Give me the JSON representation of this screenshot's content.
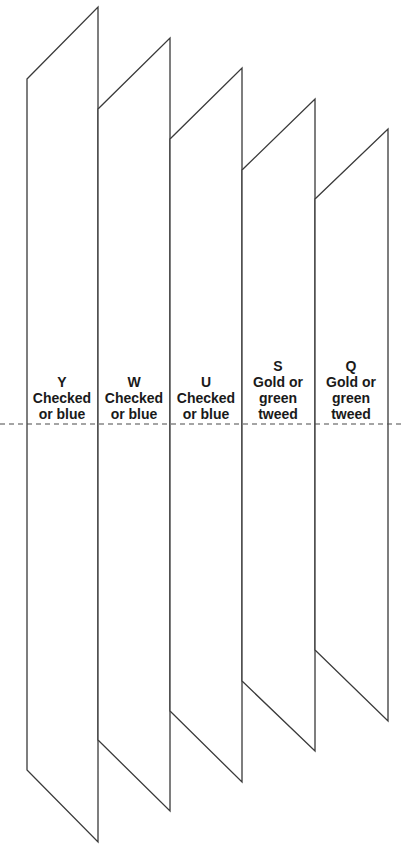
{
  "diagram": {
    "type": "folded-panels",
    "dashed_line_y": 424,
    "panels": [
      {
        "id": "Y",
        "lines": [
          "Y",
          "Checked",
          "or blue"
        ],
        "points": [
          [
            27,
            79
          ],
          [
            98,
            7
          ],
          [
            98,
            842
          ],
          [
            27,
            770
          ]
        ],
        "label_x": 26,
        "label_y": 374
      },
      {
        "id": "W",
        "lines": [
          "W",
          "Checked",
          "or blue"
        ],
        "points": [
          [
            98,
            109
          ],
          [
            170,
            38
          ],
          [
            170,
            811
          ],
          [
            98,
            740
          ]
        ],
        "label_x": 98,
        "label_y": 374
      },
      {
        "id": "U",
        "lines": [
          "U",
          "Checked",
          "or blue"
        ],
        "points": [
          [
            170,
            139
          ],
          [
            242,
            68
          ],
          [
            242,
            782
          ],
          [
            170,
            711
          ]
        ],
        "label_x": 170,
        "label_y": 374
      },
      {
        "id": "S",
        "lines": [
          "S",
          "Gold or",
          "green",
          "tweed"
        ],
        "points": [
          [
            242,
            170
          ],
          [
            315,
            99
          ],
          [
            315,
            751
          ],
          [
            242,
            681
          ]
        ],
        "label_x": 242,
        "label_y": 358
      },
      {
        "id": "Q",
        "lines": [
          "Q",
          "Gold or",
          "green",
          "tweed"
        ],
        "points": [
          [
            315,
            199
          ],
          [
            388,
            129
          ],
          [
            388,
            721
          ],
          [
            315,
            650
          ]
        ],
        "label_x": 315,
        "label_y": 358
      }
    ]
  }
}
